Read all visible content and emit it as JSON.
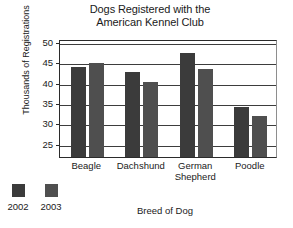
{
  "chart_data": {
    "type": "bar",
    "title": "Dogs Registered with the American Kennel Club",
    "title_lines": [
      "Dogs Registered with the",
      "American Kennel Club"
    ],
    "xlabel": "Breed of Dog",
    "ylabel": "Thousands of Registrations",
    "categories": [
      "Beagle",
      "Dachshund",
      "German Shepherd",
      "Poodle"
    ],
    "category_labels": [
      "Beagle",
      "Dachshund",
      "German\nShepherd",
      "Poodle"
    ],
    "series": [
      {
        "name": "2002",
        "color": "#3b3b3b",
        "values": [
          44.2,
          43.0,
          47.5,
          34.2
        ]
      },
      {
        "name": "2003",
        "color": "#4f4f4f",
        "values": [
          45.0,
          40.4,
          43.7,
          32.1
        ]
      }
    ],
    "ylim": [
      22,
      51
    ],
    "yticks": [
      25,
      30,
      35,
      40,
      45,
      50
    ],
    "ytick_labels": [
      "25",
      "30",
      "35",
      "40",
      "45",
      "50"
    ],
    "grid": true,
    "grid_axis": "y",
    "legend_position": "bottom-left"
  },
  "legend": {
    "entries": [
      {
        "label": "2002",
        "color": "#3b3b3b"
      },
      {
        "label": "2003",
        "color": "#4f4f4f"
      }
    ]
  }
}
